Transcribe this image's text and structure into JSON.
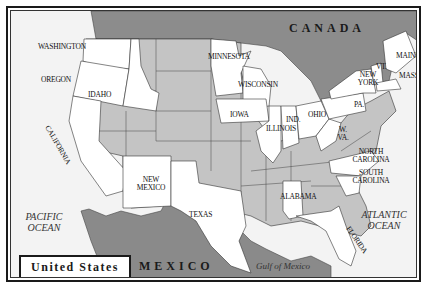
{
  "map": {
    "title": "United States",
    "countries": {
      "canada": "CANADA",
      "mexico": "MEXICO"
    },
    "water": {
      "pacific": "PACIFIC OCEAN",
      "atlantic": "ATLANTIC OCEAN",
      "gulf": "Gulf of Mexico"
    },
    "labeled_states": [
      {
        "id": "washington",
        "label": "WASHINGTON"
      },
      {
        "id": "oregon",
        "label": "OREGON"
      },
      {
        "id": "idaho",
        "label": "IDAHO"
      },
      {
        "id": "california",
        "label": "CALIFORNIA"
      },
      {
        "id": "new-mexico",
        "label": "NEW MEXICO"
      },
      {
        "id": "texas",
        "label": "TEXAS"
      },
      {
        "id": "minnesota",
        "label": "MINNESOTA"
      },
      {
        "id": "wisconsin",
        "label": "WISCONSIN"
      },
      {
        "id": "iowa",
        "label": "IOWA"
      },
      {
        "id": "illinois",
        "label": "ILLINOIS"
      },
      {
        "id": "indiana",
        "label": "IND."
      },
      {
        "id": "ohio",
        "label": "OHIO"
      },
      {
        "id": "west-virginia",
        "label": "W. VA."
      },
      {
        "id": "pennsylvania",
        "label": "PA."
      },
      {
        "id": "new-york",
        "label": "NEW YORK"
      },
      {
        "id": "vermont",
        "label": "VT."
      },
      {
        "id": "maine",
        "label": "MAINE"
      },
      {
        "id": "massachusetts",
        "label": "MASS."
      },
      {
        "id": "north-carolina",
        "label": "NORTH CAROLINA"
      },
      {
        "id": "south-carolina",
        "label": "SOUTH CAROLINA"
      },
      {
        "id": "alabama",
        "label": "ALABAMA"
      },
      {
        "id": "florida",
        "label": "FLORIDA"
      }
    ],
    "colors": {
      "highlighted_state": "#ffffff",
      "other_state": "#c4c4c4",
      "neighbor_country": "#8a8a8a",
      "water": "#f2f2f2",
      "border": "#333333"
    }
  }
}
